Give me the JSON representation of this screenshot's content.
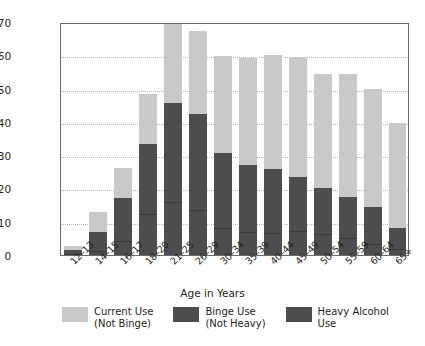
{
  "chart_data": {
    "type": "bar",
    "subtype": "stacked-bar",
    "title": "",
    "xlabel": "Age in Years",
    "ylabel": "Percent Using in Past Month",
    "ylim": [
      0,
      70
    ],
    "yticks": [
      0,
      10,
      20,
      30,
      40,
      50,
      60,
      70
    ],
    "ytick_labels": [
      "0",
      "10",
      "20",
      "30",
      "40",
      "50",
      "60",
      "70"
    ],
    "grid": true,
    "grid_axis": "y",
    "legend_position": "bottom",
    "categories": [
      "12–13",
      "14–15",
      "16–17",
      "18–20",
      "21–25",
      "26–29",
      "30–34",
      "35–39",
      "40–44",
      "45–49",
      "50–54",
      "55–59",
      "60–64",
      "65+"
    ],
    "series": [
      {
        "name": "Heavy Alcohol Use",
        "color": "#4d4d4d",
        "values": [
          0.3,
          1.2,
          4.3,
          12.3,
          16.0,
          13.4,
          8.0,
          7.0,
          6.5,
          7.2,
          6.2,
          5.0,
          3.4,
          1.8
        ]
      },
      {
        "name": "Binge Use (Not Heavy)",
        "color": "#4d4d4d",
        "values": [
          1.2,
          5.8,
          12.7,
          21.2,
          29.8,
          29.1,
          22.5,
          20.0,
          19.3,
          16.3,
          13.8,
          12.5,
          10.9,
          6.4
        ]
      },
      {
        "name": "Current Use (Not Binge)",
        "color": "#c9c9c9",
        "values": [
          1.1,
          6.0,
          9.0,
          15.0,
          23.5,
          24.8,
          29.3,
          32.1,
          34.2,
          36.0,
          34.5,
          36.9,
          35.7,
          31.5
        ]
      }
    ],
    "cumulative_tops": {
      "heavy": [
        0.3,
        1.2,
        4.3,
        12.3,
        16.0,
        13.4,
        8.0,
        7.0,
        6.5,
        7.2,
        6.2,
        5.0,
        3.4,
        1.8
      ],
      "binge": [
        1.5,
        7.0,
        17.0,
        33.5,
        45.8,
        42.5,
        30.5,
        27.0,
        25.8,
        23.5,
        20.0,
        17.5,
        14.3,
        8.2
      ],
      "total": [
        2.6,
        13.0,
        26.0,
        48.5,
        69.3,
        67.3,
        59.8,
        59.1,
        60.0,
        59.5,
        54.5,
        54.4,
        50.0,
        39.7
      ]
    }
  },
  "axes": {
    "y_title": "Percent Using in Past Month",
    "x_title": "Age in Years"
  },
  "legend": {
    "items": [
      {
        "line1": "Current Use",
        "line2": "(Not Binge)",
        "color": "#c9c9c9"
      },
      {
        "line1": "Binge Use",
        "line2": "(Not Heavy)",
        "color": "#4d4d4d"
      },
      {
        "line1": "Heavy Alcohol",
        "line2": "Use",
        "color": "#4d4d4d"
      }
    ]
  },
  "colors": {
    "current_use": "#c9c9c9",
    "binge_use": "#4d4d4d",
    "heavy_use": "#4d4d4d",
    "grid": "#b9b9b9",
    "frame": "#6b6b6b",
    "text": "#231f20",
    "background": "#ffffff"
  }
}
